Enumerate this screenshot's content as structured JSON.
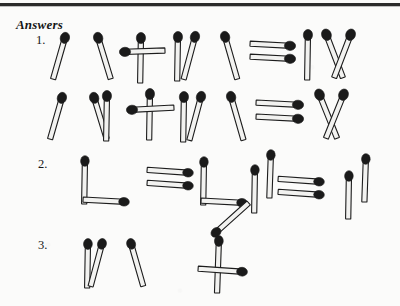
{
  "page": {
    "title": "Answers",
    "background_color": "#fbfbfa",
    "ink_color": "#1a1a1a",
    "width": 400,
    "height": 306,
    "has_top_rule": true
  },
  "items": [
    {
      "number": "1.",
      "rows": [
        {
          "expression": "V + IV = IX",
          "tokens": [
            "V",
            "+",
            "IV",
            "=",
            "IX"
          ]
        },
        {
          "expression": "VI + IV = X",
          "tokens": [
            "VI",
            "+",
            "IV",
            "=",
            "X"
          ]
        }
      ]
    },
    {
      "number": "2.",
      "rows": [
        {
          "expression": "L = L II = II",
          "tokens": [
            "L",
            "=",
            "L",
            "II",
            "=",
            "II"
          ]
        }
      ]
    },
    {
      "number": "3.",
      "rows": [
        {
          "expression": "IV 4",
          "tokens": [
            "IV",
            "4"
          ]
        }
      ]
    }
  ],
  "matchstick": {
    "head_color": "#1a1a1a",
    "stick_fill": "#f2f2f0",
    "stick_outline": "#1c1c1c"
  }
}
